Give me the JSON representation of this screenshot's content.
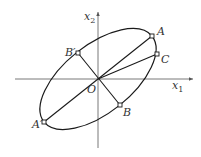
{
  "diagram": {
    "axes": {
      "x_label": "x",
      "x_sub": "1",
      "y_label": "x",
      "y_sub": "2"
    },
    "origin_label": "O",
    "points": [
      {
        "name": "A",
        "label": "A"
      },
      {
        "name": "A-prime",
        "label": "A′"
      },
      {
        "name": "B",
        "label": "B"
      },
      {
        "name": "B-prime",
        "label": "B′"
      },
      {
        "name": "C",
        "label": "C"
      }
    ],
    "colors": {
      "stroke": "#1a1a1a",
      "axis": "#555555",
      "background": "#ffffff"
    }
  }
}
